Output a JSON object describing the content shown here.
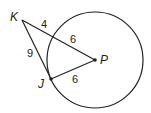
{
  "diagram": {
    "points": {
      "K": "K",
      "J": "J",
      "P": "P"
    },
    "segments": {
      "KP_outer": "4",
      "KP_inner": "6",
      "KJ": "9",
      "JP": "6"
    },
    "colors": {
      "stroke": "#222222",
      "background": "#ffffff"
    }
  }
}
